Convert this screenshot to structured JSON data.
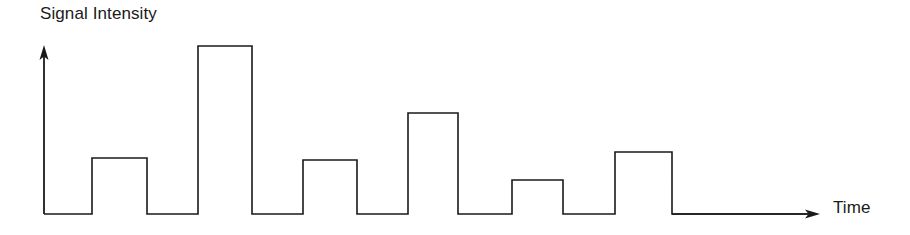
{
  "figure": {
    "name": "digital-signal-waveform",
    "background_color": "#ffffff",
    "line_color": "#1a1a1a",
    "line_width": 1.6
  },
  "axes": {
    "y_axis": {
      "label": "Signal Intensity",
      "icon": "arrow-up-icon",
      "x": 44,
      "top_y": 48,
      "bottom_y": 214
    },
    "x_axis": {
      "label": "Time",
      "icon": "arrow-right-icon",
      "y": 214,
      "left_x": 44,
      "right_x": 818
    }
  },
  "chart_data": {
    "type": "line",
    "title": "",
    "xlabel": "Time",
    "ylabel": "Signal Intensity",
    "subtitle": "",
    "grid": false,
    "legend": [],
    "legend_position": "none",
    "annotations": [],
    "xlim": [
      44,
      818
    ],
    "ylim": [
      0,
      168
    ],
    "baseline_y_px": 214,
    "axis_x_px": 44,
    "pulse_count": 6,
    "pulses": [
      {
        "index": 1,
        "x_start": 92,
        "x_end": 147,
        "top_y": 158,
        "width_px": 55,
        "height_px": 56,
        "amplitude_rel": 0.33
      },
      {
        "index": 2,
        "x_start": 198,
        "x_end": 252,
        "top_y": 46,
        "width_px": 54,
        "height_px": 168,
        "amplitude_rel": 1.0
      },
      {
        "index": 3,
        "x_start": 303,
        "x_end": 357,
        "top_y": 160,
        "width_px": 54,
        "height_px": 54,
        "amplitude_rel": 0.32
      },
      {
        "index": 4,
        "x_start": 408,
        "x_end": 458,
        "top_y": 113,
        "width_px": 50,
        "height_px": 101,
        "amplitude_rel": 0.6
      },
      {
        "index": 5,
        "x_start": 512,
        "x_end": 563,
        "top_y": 180,
        "width_px": 51,
        "height_px": 34,
        "amplitude_rel": 0.2
      },
      {
        "index": 6,
        "x_start": 615,
        "x_end": 672,
        "top_y": 152,
        "width_px": 57,
        "height_px": 62,
        "amplitude_rel": 0.37
      }
    ],
    "x": [
      44,
      92,
      92,
      147,
      147,
      198,
      198,
      252,
      252,
      303,
      303,
      357,
      357,
      408,
      408,
      458,
      458,
      512,
      512,
      563,
      563,
      615,
      615,
      672,
      672,
      810
    ],
    "values": [
      0,
      0,
      56,
      56,
      0,
      0,
      168,
      168,
      0,
      0,
      54,
      54,
      0,
      0,
      101,
      101,
      0,
      0,
      34,
      34,
      0,
      0,
      62,
      62,
      0,
      0
    ]
  }
}
